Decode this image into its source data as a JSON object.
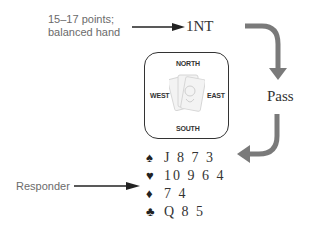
{
  "opener": {
    "label_line1": "15–17 points;",
    "label_line2": "balanced hand",
    "bid": "1NT"
  },
  "table": {
    "north": "NORTH",
    "south": "SOUTH",
    "east": "EAST",
    "west": "WEST",
    "center_icon": "card-deck-icon"
  },
  "opponent": {
    "bid": "Pass"
  },
  "responder": {
    "label": "Responder",
    "hand": [
      {
        "suit": "spades",
        "symbol": "♠",
        "cards": "J 8 7 3"
      },
      {
        "suit": "hearts",
        "symbol": "♥",
        "cards": "10 9 6 4"
      },
      {
        "suit": "diamonds",
        "symbol": "♦",
        "cards": "7 4"
      },
      {
        "suit": "clubs",
        "symbol": "♣",
        "cards": "Q 8 5"
      }
    ]
  },
  "colors": {
    "text": "#333333",
    "label": "#6b6b6b",
    "flow_arrow": "#7a7a7a"
  }
}
